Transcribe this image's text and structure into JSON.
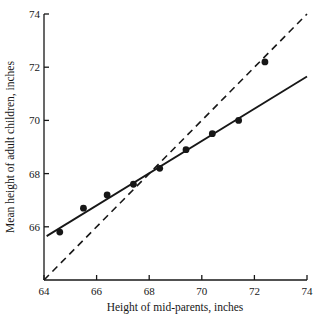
{
  "chart_data": {
    "type": "scatter",
    "title": "",
    "xlabel": "Height of mid-parents, inches",
    "ylabel": "Mean height of adult children, inches",
    "xlim": [
      64,
      74
    ],
    "ylim": [
      64,
      74
    ],
    "xticks": [
      "64",
      "66",
      "68",
      "70",
      "72",
      "74"
    ],
    "xtick_values": [
      64,
      66,
      68,
      70,
      72,
      74
    ],
    "yticks": [
      "66",
      "68",
      "70",
      "72",
      "74"
    ],
    "ytick_values": [
      66,
      68,
      70,
      72,
      74
    ],
    "grid": false,
    "legend": null,
    "points": [
      {
        "x": 64.6,
        "y": 65.8
      },
      {
        "x": 65.5,
        "y": 66.7
      },
      {
        "x": 66.4,
        "y": 67.2
      },
      {
        "x": 67.4,
        "y": 67.6
      },
      {
        "x": 68.4,
        "y": 68.2
      },
      {
        "x": 69.4,
        "y": 68.9
      },
      {
        "x": 70.4,
        "y": 69.5
      },
      {
        "x": 71.4,
        "y": 70.0
      },
      {
        "x": 72.4,
        "y": 72.2
      }
    ],
    "series": [
      {
        "name": "regression line",
        "style": "solid",
        "x": [
          64.1,
          74.0
        ],
        "y": [
          65.65,
          71.65
        ]
      },
      {
        "name": "line of equality",
        "style": "dashed",
        "x": [
          64.0,
          74.0
        ],
        "y": [
          64.0,
          74.0
        ]
      }
    ]
  },
  "colors": {
    "ink": "#171717",
    "background": "#ffffff"
  }
}
